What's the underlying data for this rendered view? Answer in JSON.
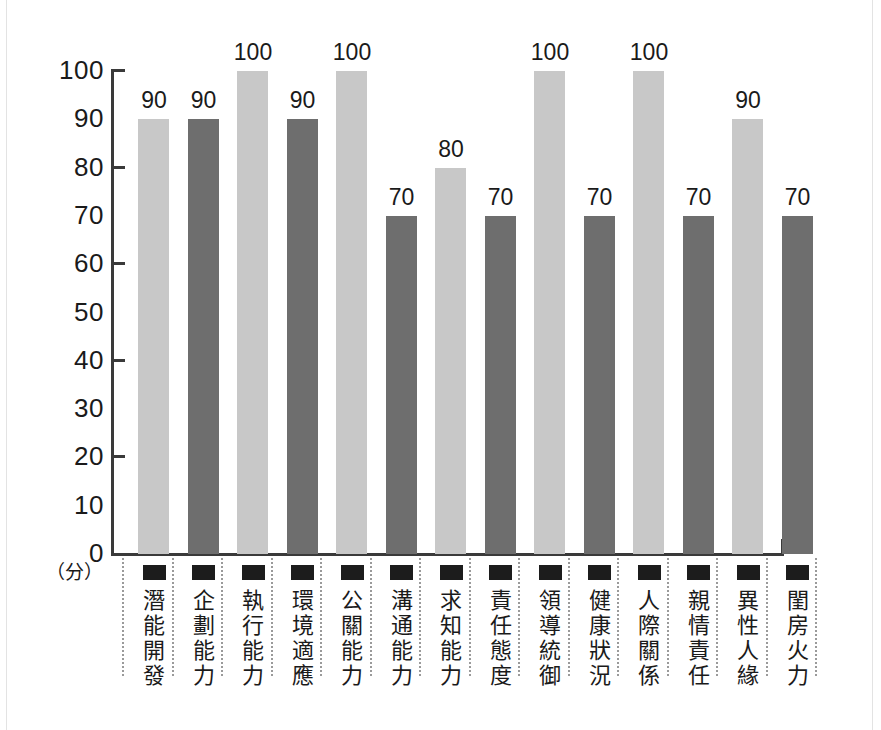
{
  "chart_data": {
    "type": "bar",
    "title": "",
    "subtitle": "",
    "xlabel": "",
    "ylabel": "（分）",
    "ylim": [
      0,
      100
    ],
    "grid": false,
    "legend": "none",
    "y_tick_labels": [
      "100",
      "90",
      "80",
      "70",
      "60",
      "50",
      "40",
      "30",
      "20",
      "10",
      "0"
    ],
    "y_tick_values": [
      100,
      90,
      80,
      70,
      60,
      50,
      40,
      30,
      20,
      10,
      0
    ],
    "y_major_ticks": [
      100,
      80,
      60,
      40,
      20,
      0
    ],
    "categories": [
      "潛能開發",
      "企劃能力",
      "執行能力",
      "環境適應",
      "公關能力",
      "溝通能力",
      "求知能力",
      "責任態度",
      "領導統御",
      "健康狀況",
      "人際關係",
      "親情責任",
      "異性人緣",
      "閨房火力"
    ],
    "values": [
      90,
      90,
      100,
      90,
      100,
      70,
      80,
      70,
      100,
      70,
      100,
      70,
      90,
      70
    ],
    "value_labels": [
      "90",
      "90",
      "100",
      "90",
      "100",
      "70",
      "80",
      "70",
      "100",
      "70",
      "100",
      "70",
      "90",
      "70"
    ],
    "bar_colors": [
      "#c8c8c8",
      "#6e6e6e",
      "#c8c8c8",
      "#6e6e6e",
      "#c8c8c8",
      "#6e6e6e",
      "#c8c8c8",
      "#6e6e6e",
      "#c8c8c8",
      "#6e6e6e",
      "#c8c8c8",
      "#6e6e6e",
      "#c8c8c8",
      "#6e6e6e"
    ],
    "colors": {
      "light_bar": "#c8c8c8",
      "dark_bar": "#6e6e6e",
      "axis": "#3a3a3a",
      "text": "#1a1a1a",
      "marker": "#1c1c1c",
      "separator": "#9a9a9a",
      "background": "#ffffff"
    },
    "marker_icon": "filled-square-marker"
  }
}
